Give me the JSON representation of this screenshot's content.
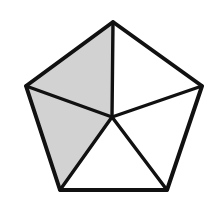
{
  "figure": {
    "name": "shaded-pentagon-five-triangles",
    "type": "geometric-diagram",
    "canvas": {
      "width": 217,
      "height": 207,
      "background": "#ffffff"
    },
    "shape": "regular pentagon divided into five triangles by spokes from an interior point",
    "colors": {
      "shaded_fill": "#d2d2d2",
      "unshaded_fill": "#ffffff",
      "edge_stroke": "#111111",
      "background": "#ffffff"
    },
    "stroke": {
      "outer_width": 4,
      "inner_width": 3.4
    },
    "vertices": [
      {
        "id": "top",
        "label": "A",
        "x": 113,
        "y": 22
      },
      {
        "id": "right",
        "label": "B",
        "x": 202,
        "y": 86
      },
      {
        "id": "bottom-right",
        "label": "C",
        "x": 167,
        "y": 190
      },
      {
        "id": "bottom-left",
        "label": "D",
        "x": 60,
        "y": 190
      },
      {
        "id": "left",
        "label": "E",
        "x": 26,
        "y": 86
      }
    ],
    "interior_point": {
      "id": "center",
      "label": "P",
      "x": 112,
      "y": 117
    },
    "triangles": [
      {
        "id": "upper-left",
        "points": "113,22 26,86 112,117",
        "shaded": true,
        "fill": "#d2d2d2"
      },
      {
        "id": "upper-right",
        "points": "113,22 202,86 112,117",
        "shaded": false,
        "fill": "#ffffff"
      },
      {
        "id": "lower-left",
        "points": "26,86 60,190 112,117",
        "shaded": true,
        "fill": "#d2d2d2"
      },
      {
        "id": "bottom",
        "points": "60,190 167,190 112,117",
        "shaded": false,
        "fill": "#ffffff"
      },
      {
        "id": "lower-right",
        "points": "167,190 202,86 112,117",
        "shaded": false,
        "fill": "#ffffff"
      }
    ],
    "outline_points": "113,22 202,86 167,190 60,190 26,86",
    "spokes": [
      {
        "id": "spoke-to-top",
        "x1": 112,
        "y1": 117,
        "x2": 113,
        "y2": 22
      },
      {
        "id": "spoke-to-right",
        "x1": 112,
        "y1": 117,
        "x2": 202,
        "y2": 86
      },
      {
        "id": "spoke-to-bottom-right",
        "x1": 112,
        "y1": 117,
        "x2": 167,
        "y2": 190
      },
      {
        "id": "spoke-to-bottom-left",
        "x1": 112,
        "y1": 117,
        "x2": 60,
        "y2": 190
      },
      {
        "id": "spoke-to-left",
        "x1": 112,
        "y1": 117,
        "x2": 26,
        "y2": 86
      }
    ],
    "shaded_count": 2,
    "total_count": 5
  }
}
